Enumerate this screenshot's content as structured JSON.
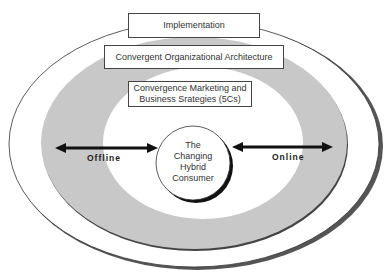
{
  "diagram": {
    "layers": {
      "implementation": "Implementation",
      "architecture": "Convergent Organizational Architecture",
      "strategies_line1": "Convergence Marketing and",
      "strategies_line2": "Business Srategies (5Cs)"
    },
    "center": {
      "line1": "The",
      "line2": "Changing",
      "line3": "Hybrid",
      "line4": "Consumer"
    },
    "arrows": {
      "left_label": "Offline",
      "right_label": "Online"
    },
    "colors": {
      "ring_fill": "#c8c8c8",
      "outline": "#333333",
      "background": "#ffffff"
    }
  }
}
